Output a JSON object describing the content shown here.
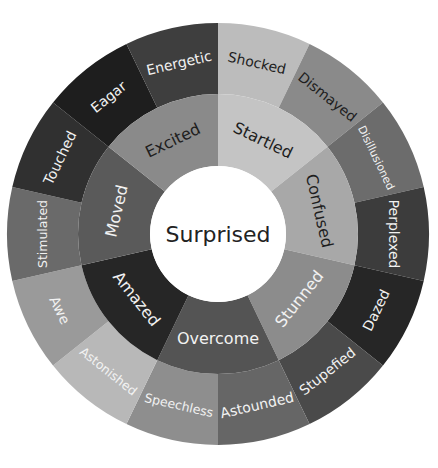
{
  "diagram": {
    "type": "sunburst",
    "center": {
      "label": "Surprised",
      "fill": "#ffffff",
      "text_color": "#222222"
    },
    "geometry": {
      "cx": 218,
      "cy": 234,
      "r_center": 68,
      "r_inner": 140,
      "r_outer": 211
    },
    "inner": [
      {
        "label": "Startled",
        "fill": "#c4c4c4",
        "text_color": "#1e1e1e",
        "outer": [
          {
            "label": "Shocked",
            "fill": "#bcbcbc",
            "text_color": "#1e1e1e"
          },
          {
            "label": "Dismayed",
            "fill": "#8a8a8a",
            "text_color": "#1e1e1e"
          }
        ]
      },
      {
        "label": "Confused",
        "fill": "#a8a8a8",
        "text_color": "#1e1e1e",
        "outer": [
          {
            "label": "Disillusioned",
            "fill": "#6c6c6c",
            "text_color": "#f2f2f2"
          },
          {
            "label": "Perplexed",
            "fill": "#3c3c3c",
            "text_color": "#f2f2f2"
          }
        ]
      },
      {
        "label": "Stunned",
        "fill": "#8c8c8c",
        "text_color": "#f2f2f2",
        "outer": [
          {
            "label": "Dazed",
            "fill": "#262626",
            "text_color": "#f2f2f2"
          },
          {
            "label": "Stupefied",
            "fill": "#4a4a4a",
            "text_color": "#f2f2f2"
          }
        ]
      },
      {
        "label": "Overcome",
        "fill": "#545454",
        "text_color": "#f2f2f2",
        "outer": [
          {
            "label": "Astounded",
            "fill": "#666666",
            "text_color": "#f2f2f2"
          },
          {
            "label": "Speechless",
            "fill": "#8e8e8e",
            "text_color": "#f2f2f2"
          }
        ]
      },
      {
        "label": "Amazed",
        "fill": "#262626",
        "text_color": "#f2f2f2",
        "outer": [
          {
            "label": "Astonished",
            "fill": "#b8b8b8",
            "text_color": "#f2f2f2"
          },
          {
            "label": "Awe",
            "fill": "#9a9a9a",
            "text_color": "#f2f2f2"
          }
        ]
      },
      {
        "label": "Moved",
        "fill": "#5a5a5a",
        "text_color": "#f2f2f2",
        "outer": [
          {
            "label": "Stimulated",
            "fill": "#6a6a6a",
            "text_color": "#f2f2f2"
          },
          {
            "label": "Touched",
            "fill": "#303030",
            "text_color": "#f2f2f2"
          }
        ]
      },
      {
        "label": "Excited",
        "fill": "#8a8a8a",
        "text_color": "#1e1e1e",
        "outer": [
          {
            "label": "Eagar",
            "fill": "#1e1e1e",
            "text_color": "#f2f2f2"
          },
          {
            "label": "Energetic",
            "fill": "#3e3e3e",
            "text_color": "#f2f2f2"
          }
        ]
      }
    ]
  }
}
